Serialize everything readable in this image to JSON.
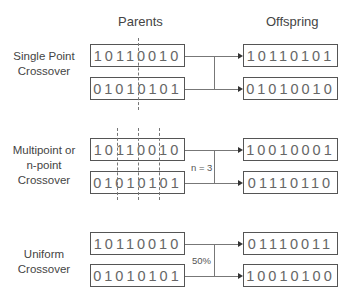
{
  "headers": {
    "parents": "Parents",
    "offspring": "Offspring"
  },
  "sections": [
    {
      "label_lines": [
        "Single Point",
        "Crossover"
      ],
      "parents": [
        "10110010",
        "01010101"
      ],
      "offspring": [
        "10110101",
        "01010010"
      ],
      "note": "",
      "cut_points": 1
    },
    {
      "label_lines": [
        "Multipoint or",
        "n-point",
        "Crossover"
      ],
      "parents": [
        "10110010",
        "01010101"
      ],
      "offspring": [
        "10010001",
        "01110110"
      ],
      "note": "n = 3",
      "cut_points": 3
    },
    {
      "label_lines": [
        "Uniform",
        "Crossover"
      ],
      "parents": [
        "10110010",
        "01010101"
      ],
      "offspring": [
        "01110011",
        "10010100"
      ],
      "note": "50%",
      "cut_points": 0
    }
  ]
}
